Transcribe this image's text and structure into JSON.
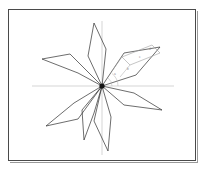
{
  "figure": {
    "background_color": "#ffffff",
    "frame_color": "#4a4a4a",
    "stroke_color": "#2e2e2e",
    "axis_color": "#b9b9b9",
    "detail_color": "#9d9d9d",
    "hub_color": "#141414"
  },
  "chart_data": {
    "type": "scatter",
    "title": "",
    "subtitle": "",
    "xlabel": "",
    "ylabel": "",
    "grid": false,
    "legend": "none",
    "center": {
      "x": 94,
      "y": 77
    },
    "axis_ranges": {
      "xlim": [
        0,
        188
      ],
      "ylim": [
        0,
        152
      ]
    },
    "petal_count": 7,
    "petals": [
      {
        "name": "petal-north",
        "tip_angle_deg": 96,
        "tip_length": 63,
        "tip": {
          "x": 86,
          "y": 14
        },
        "left_waist": {
          "x": 80,
          "y": 47
        },
        "right_waist": {
          "x": 98,
          "y": 40
        }
      },
      {
        "name": "petal-northeast",
        "tip_angle_deg": 34,
        "tip_length": 70,
        "tip": {
          "x": 152,
          "y": 38
        },
        "left_waist": {
          "x": 116,
          "y": 44
        },
        "right_waist": {
          "x": 128,
          "y": 66
        }
      },
      {
        "name": "petal-west-upper",
        "tip_angle_deg": 163,
        "tip_length": 62,
        "tip": {
          "x": 34,
          "y": 50
        },
        "left_waist": {
          "x": 62,
          "y": 45
        },
        "right_waist": {
          "x": 70,
          "y": 64
        }
      },
      {
        "name": "petal-east-lower",
        "tip_angle_deg": -24,
        "tip_length": 66,
        "tip": {
          "x": 154,
          "y": 101
        },
        "left_waist": {
          "x": 126,
          "y": 84
        },
        "right_waist": {
          "x": 116,
          "y": 96
        }
      },
      {
        "name": "petal-southwest",
        "tip_angle_deg": -155,
        "tip_length": 64,
        "tip": {
          "x": 38,
          "y": 117
        },
        "left_waist": {
          "x": 66,
          "y": 94
        },
        "right_waist": {
          "x": 70,
          "y": 110
        }
      },
      {
        "name": "petal-south",
        "tip_angle_deg": -82,
        "tip_length": 66,
        "tip": {
          "x": 100,
          "y": 142
        },
        "left_waist": {
          "x": 86,
          "y": 112
        },
        "right_waist": {
          "x": 103,
          "y": 108
        }
      },
      {
        "name": "petal-south-southwest",
        "tip_angle_deg": -108,
        "tip_length": 55,
        "tip": {
          "x": 76,
          "y": 131
        },
        "left_waist": {
          "x": 74,
          "y": 101
        },
        "right_waist": {
          "x": 86,
          "y": 104
        }
      }
    ],
    "axes": [
      {
        "name": "horizontal-axis",
        "x1": 24,
        "y1": 77,
        "x2": 166,
        "y2": 77
      },
      {
        "name": "vertical-axis",
        "x1": 94,
        "y1": 12,
        "x2": 94,
        "y2": 146
      }
    ],
    "detail_construction": {
      "name": "parallelogram-detail",
      "points": [
        {
          "x": 114,
          "y": 48
        },
        {
          "x": 144,
          "y": 36
        },
        {
          "x": 152,
          "y": 44
        },
        {
          "x": 122,
          "y": 56
        }
      ],
      "leaders": [
        {
          "x1": 122,
          "y1": 56,
          "x2": 112,
          "y2": 68
        },
        {
          "x1": 114,
          "y1": 48,
          "x2": 104,
          "y2": 62
        }
      ]
    },
    "angle_annotations": [
      {
        "label": "a",
        "x": 106,
        "y": 66
      },
      {
        "label": "b",
        "x": 119,
        "y": 61
      },
      {
        "label": "c",
        "x": 131,
        "y": 49
      },
      {
        "label": "d",
        "x": 141,
        "y": 41
      }
    ]
  }
}
